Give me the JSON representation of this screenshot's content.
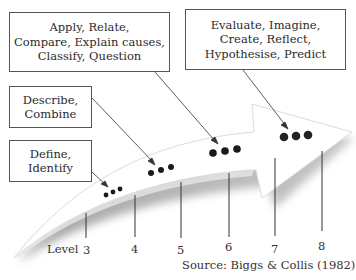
{
  "boxes": {
    "apply": {
      "lines": [
        "Apply, Relate,",
        "Compare, Explain causes,",
        "Classify, Question"
      ],
      "level": 6
    },
    "evaluate": {
      "lines": [
        "Evaluate, Imagine,",
        "Create, Reflect,",
        "Hypothesise, Predict"
      ],
      "level": 7
    },
    "describe": {
      "lines": [
        "Describe,",
        "Combine"
      ],
      "level": 5
    },
    "define": {
      "lines": [
        "Define,",
        "Identify"
      ],
      "level": 4
    }
  },
  "axis": {
    "label": "Level",
    "ticks": [
      "3",
      "4",
      "5",
      "6",
      "7",
      "8"
    ]
  },
  "dots_per_cluster": 3,
  "source": "Source: Biggs & Collis (1982)",
  "colors": {
    "border": "#555555",
    "dot": "#1a1a1a",
    "arrow_shadow": "#9a9a9a",
    "text": "#2a2a2a"
  }
}
